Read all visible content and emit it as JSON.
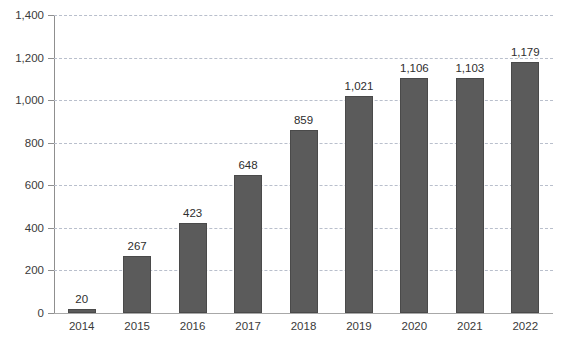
{
  "chart_data": {
    "type": "bar",
    "title": "",
    "subtitle": "",
    "xlabel": "",
    "ylabel": "",
    "categories": [
      "2014",
      "2015",
      "2016",
      "2017",
      "2018",
      "2019",
      "2020",
      "2021",
      "2022"
    ],
    "values": [
      20,
      267,
      423,
      648,
      859,
      1021,
      1106,
      1103,
      1179
    ],
    "value_labels": [
      "20",
      "267",
      "423",
      "648",
      "859",
      "1,021",
      "1,106",
      "1,103",
      "1,179"
    ],
    "ylim": [
      0,
      1400
    ],
    "ytick_values": [
      0,
      200,
      400,
      600,
      800,
      1000,
      1200,
      1400
    ],
    "ytick_labels": [
      "0",
      "200",
      "400",
      "600",
      "800",
      "1,000",
      "1,200",
      "1,400"
    ],
    "grid": true,
    "grid_axis": "y",
    "grid_style": "dashed",
    "legend": false,
    "legend_position": "none",
    "bar_color": "#5b5b5b",
    "bar_edge_color": "#4a4a4a",
    "grid_color": "#b9bfcc",
    "axis_color": "#8f8f8f",
    "text_color": "#3a3a3a",
    "background_color": "#ffffff"
  }
}
